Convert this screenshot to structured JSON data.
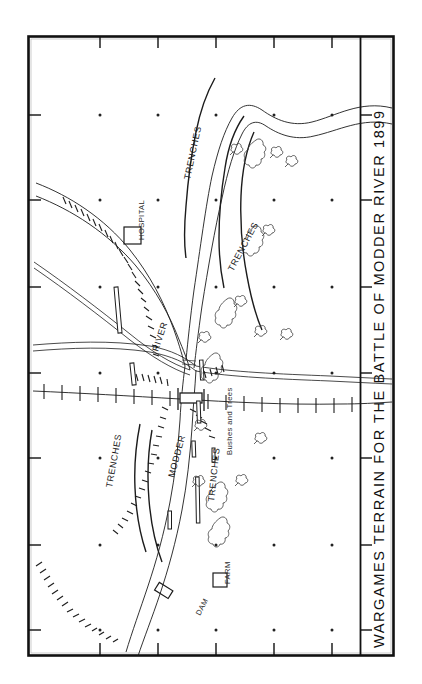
{
  "document": {
    "type": "map",
    "title": "WARGAMES TERRAIN FOR THE BATTLE OF MODDER RIVER 1899",
    "title_orientation": "vertical-rotated-90",
    "background_color": "#ffffff",
    "ink_color": "#1c1c1c"
  },
  "map": {
    "frame": {
      "label": "map-border",
      "x": 28,
      "y": 36,
      "width": 332,
      "height": 620,
      "tick_marks": true
    },
    "grid": {
      "label": "survey-grid-dots",
      "spacing_px": 58,
      "dot_color": "#222222"
    },
    "labels": [
      {
        "id": "river-main",
        "text": "RIVER",
        "x": 152,
        "y": 330
      },
      {
        "id": "river-modder",
        "text": "MODDER",
        "x": 168,
        "y": 452
      },
      {
        "id": "hospital",
        "text": "HOSPITAL",
        "x": 137,
        "y": 198
      },
      {
        "id": "farm",
        "text": "FARM",
        "x": 233,
        "y": 572
      },
      {
        "id": "dam",
        "text": "DAM",
        "x": 210,
        "y": 610
      },
      {
        "id": "trenches-1",
        "text": "TRENCHES",
        "x": 190,
        "y": 152
      },
      {
        "id": "trenches-2",
        "text": "TRENCHES",
        "x": 235,
        "y": 245
      },
      {
        "id": "trenches-3",
        "text": "TRENCHES",
        "x": 105,
        "y": 452
      },
      {
        "id": "trenches-4",
        "text": "TRENCHES",
        "x": 212,
        "y": 468
      },
      {
        "id": "bushes-and-trees",
        "text": "Bushes and Trees",
        "x": 228,
        "y": 400
      }
    ],
    "symbols": {
      "hospital_marker": "square-building-symbol",
      "farm_marker": "square-building-symbol",
      "dam_marker": "dam-bar-symbol",
      "bridge_marker": "railway-bridge-symbol",
      "tree_marker": "tree-symbol",
      "bush_marker": "bush-clump-symbol",
      "trench_marker": "trench-bar-symbol",
      "ridge_marker": "hachured-ridge-symbol",
      "railway_marker": "railway-sleeper-line",
      "road_marker": "double-line-road",
      "river_marker": "double-line-river"
    }
  },
  "legend_terms": {
    "river": "RIVER",
    "modder": "MODDER",
    "trenches": "TRENCHES",
    "bushes_trees": "Bushes and Trees",
    "hospital": "HOSPITAL",
    "farm": "FARM",
    "dam": "DAM"
  }
}
